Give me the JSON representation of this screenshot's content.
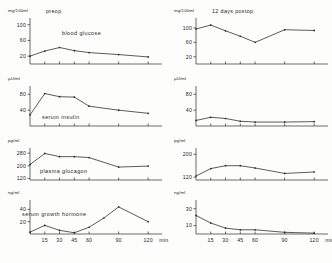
{
  "figure": {
    "background": "#fdfdfc",
    "ink_color": "#262626"
  },
  "columns": [
    {
      "id": "preop",
      "title": "preop."
    },
    {
      "id": "postop",
      "title": "12 days postop"
    }
  ],
  "axis": {
    "x_unit_suffix": "min",
    "x_tick_labels": [
      "15",
      "30",
      "45",
      "60",
      "90",
      "120"
    ],
    "x_values": [
      15,
      30,
      45,
      60,
      90,
      120
    ],
    "x_range": [
      0,
      132
    ]
  },
  "chart_data": [
    {
      "type": "line",
      "title": "preop.",
      "series_label": "blood glucose",
      "ylabel": "mg/100ml",
      "xlabel": "min",
      "x": [
        0,
        15,
        30,
        45,
        60,
        90,
        120
      ],
      "values": [
        20,
        33,
        42,
        34,
        29,
        24,
        18
      ],
      "ylim": [
        0,
        112
      ],
      "yticks": [
        20,
        60,
        100
      ],
      "ytick_labels": [
        "20",
        "60",
        "100"
      ],
      "grid": false,
      "legend": "none"
    },
    {
      "type": "line",
      "title": "preop.",
      "series_label": "serum insulin",
      "ylabel": "µU/ml",
      "xlabel": "min",
      "x": [
        0,
        15,
        30,
        45,
        60,
        90,
        120
      ],
      "values": [
        28,
        82,
        74,
        73,
        50,
        40,
        32
      ],
      "ylim": [
        0,
        96
      ],
      "yticks": [
        40,
        80
      ],
      "ytick_labels": [
        "40",
        "80"
      ],
      "grid": false,
      "legend": "none"
    },
    {
      "type": "line",
      "title": "preop.",
      "series_label": "plasma glucagon",
      "ylabel": "pg/ml",
      "xlabel": "min",
      "x": [
        0,
        15,
        30,
        45,
        60,
        90,
        120
      ],
      "values": [
        208,
        278,
        258,
        258,
        252,
        192,
        198
      ],
      "ylim": [
        110,
        300
      ],
      "yticks": [
        120,
        200,
        280
      ],
      "ytick_labels": [
        "120",
        "200",
        "280"
      ],
      "grid": false,
      "legend": "none"
    },
    {
      "type": "line",
      "title": "preop.",
      "series_label": "serum growth hormone",
      "ylabel": "ng/ml",
      "xlabel": "min",
      "x": [
        0,
        15,
        30,
        45,
        60,
        75,
        90,
        120
      ],
      "values": [
        3,
        14,
        6,
        2,
        11,
        26,
        44,
        20
      ],
      "ylim": [
        0,
        52
      ],
      "yticks": [
        20,
        40
      ],
      "ytick_labels": [
        "20",
        "40"
      ],
      "grid": false,
      "legend": "none"
    },
    {
      "type": "line",
      "title": "12 days postop",
      "series_label": "",
      "ylabel": "mg/100ml",
      "xlabel": "min",
      "x": [
        0,
        15,
        30,
        45,
        60,
        90,
        120
      ],
      "values": [
        97,
        108,
        92,
        77,
        60,
        95,
        93
      ],
      "ylim": [
        0,
        122
      ],
      "yticks": [
        20,
        60,
        100
      ],
      "ytick_labels": [
        "20",
        "60",
        "100"
      ],
      "grid": false,
      "legend": "none"
    },
    {
      "type": "line",
      "title": "12 days postop",
      "series_label": "",
      "ylabel": "µU/ml",
      "xlabel": "min",
      "x": [
        0,
        15,
        30,
        45,
        60,
        90,
        120
      ],
      "values": [
        14,
        22,
        19,
        12,
        10,
        10,
        11
      ],
      "ylim": [
        0,
        96
      ],
      "yticks": [
        40,
        80
      ],
      "ytick_labels": [
        "40",
        "80"
      ],
      "grid": false,
      "legend": "none"
    },
    {
      "type": "line",
      "title": "12 days postop",
      "series_label": "",
      "ylabel": "pg/ml",
      "xlabel": "min",
      "x": [
        0,
        15,
        30,
        45,
        60,
        90,
        120
      ],
      "values": [
        124,
        150,
        160,
        160,
        152,
        133,
        138
      ],
      "ylim": [
        110,
        215
      ],
      "yticks": [
        120,
        200
      ],
      "ytick_labels": [
        "120",
        "200"
      ],
      "grid": false,
      "legend": "none"
    },
    {
      "type": "line",
      "title": "12 days postop",
      "series_label": "",
      "ylabel": "ng/ml",
      "xlabel": "min",
      "x": [
        0,
        15,
        30,
        45,
        60,
        90,
        120
      ],
      "values": [
        22,
        13,
        7,
        5,
        5,
        2,
        1
      ],
      "ylim": [
        0,
        38
      ],
      "yticks": [
        10,
        30
      ],
      "ytick_labels": [
        "10",
        "30"
      ],
      "grid": false,
      "legend": "none"
    }
  ]
}
